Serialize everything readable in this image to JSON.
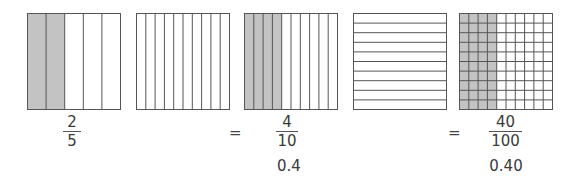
{
  "colors": {
    "shade": "#c3c3c3",
    "line": "#555555",
    "background": "#ffffff"
  },
  "grids": [
    {
      "id": "fifths",
      "columns": 5,
      "rows": 1,
      "shaded_columns": 2,
      "label": "2 of 5 columns shaded"
    },
    {
      "id": "tenths-blank",
      "columns": 10,
      "rows": 1,
      "shaded_columns": 0,
      "label": "10 columns, none shaded"
    },
    {
      "id": "tenths",
      "columns": 10,
      "rows": 1,
      "shaded_columns": 4,
      "label": "4 of 10 columns shaded"
    },
    {
      "id": "tenths-rows",
      "columns": 1,
      "rows": 10,
      "shaded_columns": 0,
      "label": "10 rows, none shaded"
    },
    {
      "id": "hundredths",
      "columns": 10,
      "rows": 10,
      "shaded_columns": 4,
      "label": "40 of 100 squares shaded"
    }
  ],
  "fractions": [
    {
      "numerator": "2",
      "denominator": "5"
    },
    {
      "numerator": "4",
      "denominator": "10"
    },
    {
      "numerator": "40",
      "denominator": "100"
    }
  ],
  "equals": [
    "=",
    "="
  ],
  "decimals": [
    "0.4",
    "0.40"
  ]
}
